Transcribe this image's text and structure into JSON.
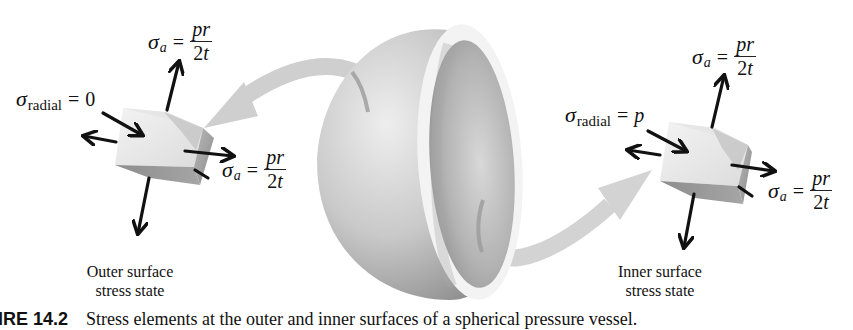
{
  "figure": {
    "outer": {
      "label_line1": "Outer surface",
      "label_line2": "stress state",
      "radial": {
        "symbol": "σ",
        "subscript": "radial",
        "equals": "=",
        "value": "0"
      },
      "axial_top": {
        "symbol": "σ",
        "subscript": "a",
        "equals": "=",
        "numerator": "pr",
        "denominator_num": "2",
        "denominator_var": "t"
      },
      "axial_right": {
        "symbol": "σ",
        "subscript": "a",
        "equals": "=",
        "numerator": "pr",
        "denominator_num": "2",
        "denominator_var": "t"
      }
    },
    "inner": {
      "label_line1": "Inner surface",
      "label_line2": "stress state",
      "radial": {
        "symbol": "σ",
        "subscript": "radial",
        "equals": "=",
        "value": "p"
      },
      "axial_top": {
        "symbol": "σ",
        "subscript": "a",
        "equals": "=",
        "numerator": "pr",
        "denominator_num": "2",
        "denominator_var": "t"
      },
      "axial_right": {
        "symbol": "σ",
        "subscript": "a",
        "equals": "=",
        "numerator": "pr",
        "denominator_num": "2",
        "denominator_var": "t"
      }
    },
    "caption": {
      "figure_number": "IRE 14.2",
      "text": "Stress elements at the outer and inner surfaces of a spherical pressure vessel."
    },
    "colors": {
      "arrow": "#111111",
      "callout_arrow": "#c8c8c8",
      "sphere_light": "#e8e8e8",
      "sphere_dark": "#9a9a9a",
      "rim": "#f2f2f2"
    }
  }
}
